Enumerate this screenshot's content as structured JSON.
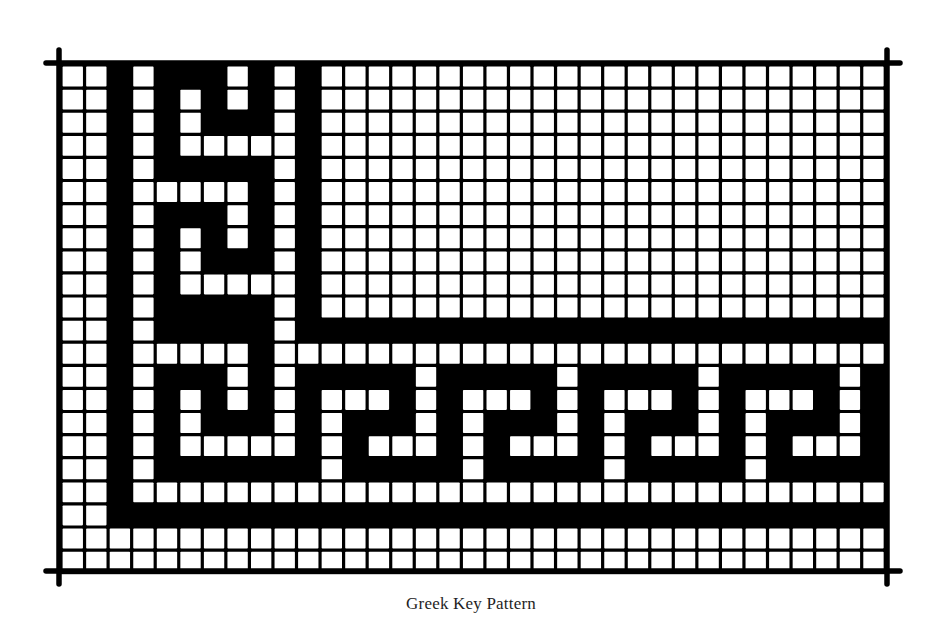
{
  "caption": "Greek Key Pattern",
  "colors": {
    "ink": "#000000",
    "paper": "#ffffff",
    "caption": "#1f1f1f"
  },
  "grid": {
    "columns": 35,
    "rows": 22,
    "origin_x": 61,
    "origin_y": 65,
    "cell_w": 23.55,
    "cell_h": 23.1,
    "line_width": 3.2,
    "legend": {
      "1": "black filled cell",
      "0": "white open cell"
    },
    "cells": [
      "00101110101000000000000000000000000",
      "00101010101000000000000000000000000",
      "00101011101000000000000000000000000",
      "00101000001000000000000000000000000",
      "00101111101000000000000000000000000",
      "00100000101000000000000000000000000",
      "00101110101000000000000000000000000",
      "00101010101000000000000000000000000",
      "00101011101000000000000000000000000",
      "00101000001000000000000000000000000",
      "00101111101000000000000000000000000",
      "00101111101111111111111111111111111",
      "00100000100000000000000000000000000",
      "00101110101111101111101111101111101",
      "00101010101000101000101000101000101",
      "00101011101011101011101011101011101",
      "00101000001010001010001010001010001",
      "00101111111011111011111011111011111",
      "00100000000000000000000000000000000",
      "00111111111111111111111111111111111",
      "00000000000000000000000000000000000",
      "00000000000000000000000000000000000"
    ]
  },
  "frame": {
    "left_x": 59,
    "right_x": 887,
    "top_y": 63,
    "bottom_y": 571,
    "corner_overhang": 13,
    "stroke": 5.5
  }
}
